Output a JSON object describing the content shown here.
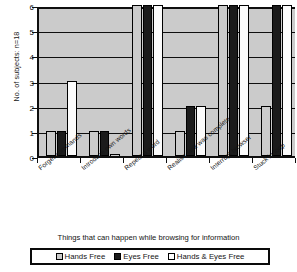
{
  "chart_data": {
    "type": "bar",
    "title": "",
    "xlabel": "Things that can happen while browsing for information",
    "ylabel": "No. of subjects: n=18",
    "ylim": [
      0,
      6
    ],
    "yticks": [
      0,
      1,
      2,
      3,
      4,
      5,
      6
    ],
    "grid": true,
    "legend_position": "bottom",
    "categories": [
      "Forget commands",
      "Introduce own words",
      "Repeat a word",
      "Realise task was complete",
      "Interrupt browser",
      "Stuck in loop"
    ],
    "series": [
      {
        "name": "Hands Free",
        "color": "#cbcbcb",
        "values": [
          1,
          1,
          6,
          1,
          6,
          2
        ]
      },
      {
        "name": "Eyes Free",
        "color": "#1b1b1b",
        "values": [
          1,
          1,
          6,
          2,
          6,
          6
        ]
      },
      {
        "name": "Hands & Eyes Free",
        "color": "#ffffff",
        "values": [
          3,
          0,
          6,
          2,
          6,
          6
        ]
      }
    ]
  },
  "legend": {
    "items": [
      {
        "label": "Hands Free"
      },
      {
        "label": "Eyes Free"
      },
      {
        "label": "Hands & Eyes Free"
      }
    ]
  }
}
